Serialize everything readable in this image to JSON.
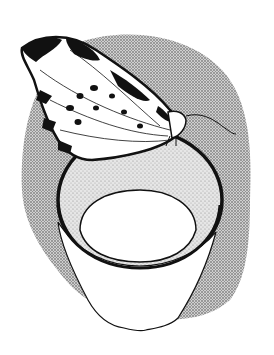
{
  "image": {
    "subject": "Butterfly perched on the rim of a cup",
    "style": "black-and-white stippled ink illustration",
    "colors": {
      "background": "#ffffff",
      "ink": "#111111",
      "stipple": "#b8b8b8",
      "stipple_light": "#d6d6d6"
    }
  }
}
